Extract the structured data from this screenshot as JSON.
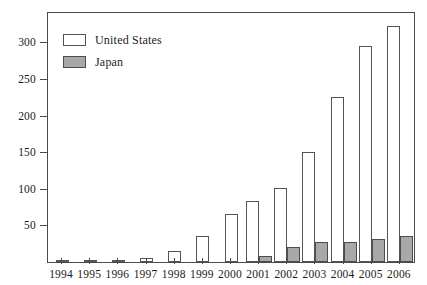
{
  "chart_data": {
    "type": "bar",
    "title": "",
    "subtitle": "",
    "xlabel": "",
    "ylabel": "",
    "categories": [
      "1994",
      "1995",
      "1996",
      "1997",
      "1998",
      "1999",
      "2000",
      "2001",
      "2002",
      "2003",
      "2004",
      "2005",
      "2006"
    ],
    "series": [
      {
        "name": "United States",
        "color": "#ffffff",
        "values": [
          1,
          2,
          3,
          6,
          15,
          35,
          66,
          83,
          101,
          150,
          225,
          295,
          322
        ]
      },
      {
        "name": "Japan",
        "color": "#a8a8a8",
        "values": [
          0,
          0,
          0,
          0,
          0,
          0,
          0,
          8,
          20,
          27,
          27,
          32,
          36
        ]
      }
    ],
    "ylim": [
      0,
      340
    ],
    "yticks": [
      50,
      100,
      150,
      200,
      250,
      300
    ],
    "ytick_labels": [
      "50",
      "100",
      "150",
      "200",
      "250",
      "300"
    ],
    "grid": false,
    "legend_position": "top-left",
    "legend_entries": [
      "United States",
      "Japan"
    ]
  },
  "legend": {
    "items": [
      {
        "label": "United States",
        "swatch": "white-square-icon"
      },
      {
        "label": "Japan",
        "swatch": "gray-square-icon"
      }
    ]
  }
}
